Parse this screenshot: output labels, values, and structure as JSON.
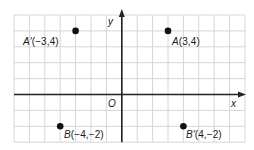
{
  "diagram": {
    "type": "coordinate-plane",
    "grid": {
      "left_px": 14,
      "top_px": 15,
      "cell_w": 15.4,
      "cell_h": 15.9,
      "cols": 15,
      "rows": 8,
      "origin_col": 7,
      "origin_row": 5,
      "grid_color": "#d6d6d6",
      "axis_color": "#222222"
    },
    "axes": {
      "x_label": "x",
      "y_label": "y",
      "origin_label": "O"
    },
    "points": [
      {
        "id": "A_prime",
        "name": "A′",
        "coords": "(−3,4)",
        "x": -3,
        "y": 4,
        "label_pos": "left"
      },
      {
        "id": "A",
        "name": "A",
        "coords": "(3,4)",
        "x": 3,
        "y": 4,
        "label_pos": "right-below"
      },
      {
        "id": "B",
        "name": "B",
        "coords": "(−4,−2)",
        "x": -4,
        "y": -2,
        "label_pos": "right-below"
      },
      {
        "id": "B_prime",
        "name": "B′",
        "coords": "(4,−2)",
        "x": 4,
        "y": -2,
        "label_pos": "right-below"
      }
    ],
    "labels": {
      "a_prime": {
        "name": "A′",
        "coords": "(−3,4)"
      },
      "a": {
        "name": "A",
        "coords": "(3,4)"
      },
      "b": {
        "name": "B",
        "coords": "(−4,−2)"
      },
      "b_prime": {
        "name": "B′",
        "coords": "(4,−2)"
      }
    }
  }
}
